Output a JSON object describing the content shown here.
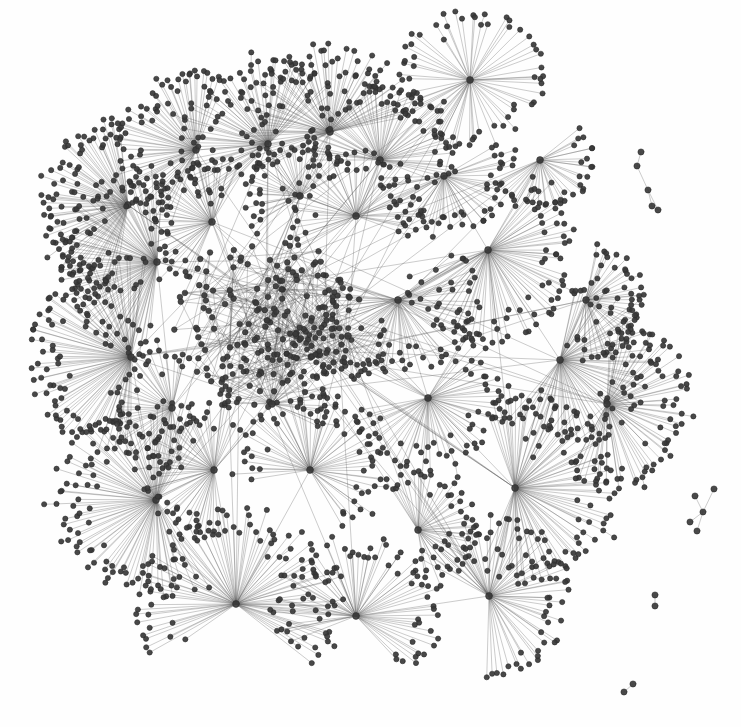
{
  "figure": {
    "description": "Large undirected network laid out with a force-directed algorithm, showing one giant connected component with a dense core and many hub-and-spoke (star) clusters on the periphery, plus four small isolated components at the right.",
    "background_color": "#fefefe",
    "width": 741,
    "height": 727
  },
  "style": {
    "node_color": "#3a3a3a",
    "node_stroke_color": "#2b2b2b",
    "edge_color": "#555555",
    "leaf_node_radius": 2.6,
    "core_node_radius": 2.8,
    "hub_node_radius": 3.4,
    "edge_width": 0.55,
    "edge_opacity": 0.55,
    "node_opacity": 0.92
  },
  "chart_data": {
    "type": "scatter",
    "xlabel": "",
    "ylabel": "",
    "xlim": [
      0,
      741
    ],
    "ylim": [
      0,
      727
    ],
    "grid": false,
    "legend": "none",
    "layout": "force-directed",
    "summary": {
      "approx_total_nodes": 2300,
      "approx_total_edges": 2400,
      "giant_component_nodes": 2285,
      "isolated_components": 4,
      "hub_count": 30,
      "core_node_count": 170,
      "core_center": [
        268,
        320
      ],
      "core_radius": 95
    },
    "hubs": [
      {
        "id": "h01",
        "x": 128,
        "y": 205,
        "leaves": 74,
        "r_in": 18,
        "r_out": 92,
        "a0": 100,
        "a1": 265,
        "label": "hub-nw-1"
      },
      {
        "id": "h02",
        "x": 157,
        "y": 262,
        "leaves": 80,
        "r_in": 18,
        "r_out": 100,
        "a0": 95,
        "a1": 275,
        "label": "hub-w-1"
      },
      {
        "id": "h03",
        "x": 131,
        "y": 357,
        "leaves": 86,
        "r_in": 18,
        "r_out": 104,
        "a0": 90,
        "a1": 280,
        "label": "hub-w-2"
      },
      {
        "id": "h04",
        "x": 196,
        "y": 150,
        "leaves": 64,
        "r_in": 16,
        "r_out": 84,
        "a0": 110,
        "a1": 290,
        "label": "hub-n-1"
      },
      {
        "id": "h05",
        "x": 268,
        "y": 144,
        "leaves": 70,
        "r_in": 16,
        "r_out": 88,
        "a0": 130,
        "a1": 320,
        "label": "hub-n-2"
      },
      {
        "id": "h06",
        "x": 330,
        "y": 132,
        "leaves": 74,
        "r_in": 16,
        "r_out": 92,
        "a0": 150,
        "a1": 350,
        "label": "hub-n-3"
      },
      {
        "id": "h07",
        "x": 380,
        "y": 160,
        "leaves": 60,
        "r_in": 16,
        "r_out": 80,
        "a0": 180,
        "a1": 380,
        "label": "hub-n-4"
      },
      {
        "id": "h08",
        "x": 470,
        "y": 80,
        "leaves": 58,
        "r_in": 14,
        "r_out": 76,
        "a0": 0,
        "a1": 360,
        "label": "hub-ne-iso"
      },
      {
        "id": "h09",
        "x": 488,
        "y": 250,
        "leaves": 72,
        "r_in": 16,
        "r_out": 96,
        "a0": -60,
        "a1": 160,
        "label": "hub-e-1"
      },
      {
        "id": "h10",
        "x": 560,
        "y": 360,
        "leaves": 70,
        "r_in": 16,
        "r_out": 92,
        "a0": -80,
        "a1": 130,
        "label": "hub-e-2"
      },
      {
        "id": "h11",
        "x": 607,
        "y": 404,
        "leaves": 66,
        "r_in": 16,
        "r_out": 88,
        "a0": -90,
        "a1": 120,
        "label": "hub-e-3"
      },
      {
        "id": "h12",
        "x": 515,
        "y": 488,
        "leaves": 80,
        "r_in": 18,
        "r_out": 100,
        "a0": -110,
        "a1": 110,
        "label": "hub-se-1"
      },
      {
        "id": "h13",
        "x": 489,
        "y": 596,
        "leaves": 62,
        "r_in": 16,
        "r_out": 84,
        "a0": -150,
        "a1": 90,
        "label": "hub-se-2"
      },
      {
        "id": "h14",
        "x": 356,
        "y": 616,
        "leaves": 64,
        "r_in": 16,
        "r_out": 86,
        "a0": -200,
        "a1": 50,
        "label": "hub-s-1"
      },
      {
        "id": "h15",
        "x": 236,
        "y": 604,
        "leaves": 84,
        "r_in": 18,
        "r_out": 102,
        "a0": -215,
        "a1": 40,
        "label": "hub-s-2"
      },
      {
        "id": "h16",
        "x": 156,
        "y": 500,
        "leaves": 90,
        "r_in": 18,
        "r_out": 106,
        "a0": 60,
        "a1": 300,
        "label": "hub-sw-1"
      },
      {
        "id": "h17",
        "x": 214,
        "y": 470,
        "leaves": 54,
        "r_in": 14,
        "r_out": 74,
        "a0": 80,
        "a1": 290,
        "label": "hub-sw-2"
      },
      {
        "id": "h18",
        "x": 310,
        "y": 470,
        "leaves": 56,
        "r_in": 14,
        "r_out": 78,
        "a0": -190,
        "a1": 60,
        "label": "hub-s-3"
      },
      {
        "id": "h19",
        "x": 398,
        "y": 300,
        "leaves": 62,
        "r_in": 16,
        "r_out": 82,
        "a0": -40,
        "a1": 200,
        "label": "hub-c-e"
      },
      {
        "id": "h20",
        "x": 428,
        "y": 398,
        "leaves": 58,
        "r_in": 14,
        "r_out": 78,
        "a0": -60,
        "a1": 170,
        "label": "hub-c-se"
      },
      {
        "id": "h21",
        "x": 356,
        "y": 216,
        "leaves": 50,
        "r_in": 14,
        "r_out": 70,
        "a0": 150,
        "a1": 380,
        "label": "hub-c-ne"
      },
      {
        "id": "h22",
        "x": 212,
        "y": 222,
        "leaves": 48,
        "r_in": 14,
        "r_out": 68,
        "a0": 110,
        "a1": 300,
        "label": "hub-c-nw"
      },
      {
        "id": "h23",
        "x": 444,
        "y": 176,
        "leaves": 44,
        "r_in": 12,
        "r_out": 64,
        "a0": -30,
        "a1": 180,
        "label": "hub-ne-2"
      },
      {
        "id": "h24",
        "x": 586,
        "y": 300,
        "leaves": 40,
        "r_in": 12,
        "r_out": 60,
        "a0": -80,
        "a1": 110,
        "label": "hub-e-4"
      },
      {
        "id": "h25",
        "x": 300,
        "y": 196,
        "leaves": 40,
        "r_in": 12,
        "r_out": 58,
        "a0": 140,
        "a1": 330,
        "label": "hub-n-5"
      },
      {
        "id": "h26",
        "x": 172,
        "y": 408,
        "leaves": 44,
        "r_in": 12,
        "r_out": 64,
        "a0": 80,
        "a1": 285,
        "label": "hub-w-3"
      },
      {
        "id": "h27",
        "x": 418,
        "y": 530,
        "leaves": 42,
        "r_in": 12,
        "r_out": 62,
        "a0": -120,
        "a1": 80,
        "label": "hub-s-4"
      },
      {
        "id": "h28",
        "x": 272,
        "y": 404,
        "leaves": 38,
        "r_in": 12,
        "r_out": 56,
        "a0": -180,
        "a1": 30,
        "label": "hub-c-s"
      },
      {
        "id": "h29",
        "x": 540,
        "y": 160,
        "leaves": 34,
        "r_in": 12,
        "r_out": 54,
        "a0": -40,
        "a1": 150,
        "label": "hub-ne-3"
      },
      {
        "id": "h30",
        "x": 348,
        "y": 336,
        "leaves": 30,
        "r_in": 10,
        "r_out": 46,
        "a0": -20,
        "a1": 200,
        "label": "hub-core-e"
      }
    ],
    "hub_links": [
      [
        "h01",
        "h02"
      ],
      [
        "h02",
        "h03"
      ],
      [
        "h02",
        "h22"
      ],
      [
        "h22",
        "h04"
      ],
      [
        "h04",
        "h05"
      ],
      [
        "h05",
        "h06"
      ],
      [
        "h06",
        "h07"
      ],
      [
        "h07",
        "h21"
      ],
      [
        "h21",
        "h23"
      ],
      [
        "h23",
        "h09"
      ],
      [
        "h09",
        "h29"
      ],
      [
        "h09",
        "h10"
      ],
      [
        "h10",
        "h11"
      ],
      [
        "h10",
        "h24"
      ],
      [
        "h11",
        "h12"
      ],
      [
        "h12",
        "h13"
      ],
      [
        "h13",
        "h14"
      ],
      [
        "h14",
        "h15"
      ],
      [
        "h15",
        "h16"
      ],
      [
        "h16",
        "h17"
      ],
      [
        "h17",
        "h26"
      ],
      [
        "h26",
        "h03"
      ],
      [
        "h18",
        "h15"
      ],
      [
        "h18",
        "h28"
      ],
      [
        "h19",
        "h09"
      ],
      [
        "h19",
        "h30"
      ],
      [
        "h20",
        "h19"
      ],
      [
        "h20",
        "h12"
      ],
      [
        "h27",
        "h13"
      ],
      [
        "h27",
        "h20"
      ],
      [
        "h25",
        "h05"
      ],
      [
        "h25",
        "h21"
      ],
      [
        "h08",
        "h06"
      ],
      [
        "h08",
        "h23"
      ],
      [
        "h03",
        "h16"
      ],
      [
        "h02",
        "h26"
      ],
      [
        "h09",
        "h12"
      ],
      [
        "h30",
        "h20"
      ],
      [
        "h21",
        "h30"
      ],
      [
        "h28",
        "h17"
      ]
    ],
    "isolated_components": [
      {
        "id": "iso1",
        "label": "chain-component-ne",
        "nodes": [
          [
            641,
            152
          ],
          [
            637,
            166
          ],
          [
            648,
            190
          ],
          [
            652,
            206
          ],
          [
            658,
            210
          ]
        ],
        "edges": [
          [
            0,
            1
          ],
          [
            1,
            2
          ],
          [
            2,
            3
          ],
          [
            3,
            4
          ],
          [
            2,
            4
          ]
        ]
      },
      {
        "id": "iso2",
        "label": "x-component-e",
        "nodes": [
          [
            714,
            489
          ],
          [
            695,
            496
          ],
          [
            703,
            512
          ],
          [
            690,
            522
          ],
          [
            697,
            531
          ]
        ],
        "edges": [
          [
            0,
            2
          ],
          [
            1,
            2
          ],
          [
            2,
            3
          ],
          [
            2,
            4
          ]
        ]
      },
      {
        "id": "iso3",
        "label": "dyad-component-se",
        "nodes": [
          [
            655,
            595
          ],
          [
            655,
            606
          ]
        ],
        "edges": [
          [
            0,
            1
          ]
        ]
      },
      {
        "id": "iso4",
        "label": "dyad-component-s",
        "nodes": [
          [
            633,
            684
          ],
          [
            624,
            692
          ]
        ],
        "edges": [
          [
            0,
            1
          ]
        ]
      }
    ]
  }
}
